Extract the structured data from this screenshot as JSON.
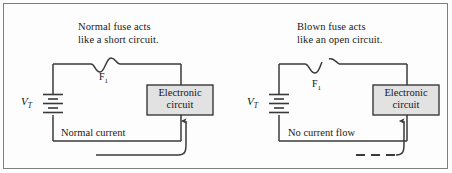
{
  "figure": {
    "border_color": "#7e7e7e",
    "background": "#fdfdfd",
    "wire_color": "#3a3a3a",
    "box_fill": "#e2e2e2",
    "box_border": "#2b2b2b",
    "text_color": "#1a1a1a"
  },
  "panels": [
    {
      "id": "normal-fuse-panel",
      "caption_line1": "Normal fuse acts",
      "caption_line2": "like a short circuit.",
      "source_label": "V",
      "source_subscript": "T",
      "fuse_label": "F",
      "fuse_subscript": "1",
      "fuse_state": "intact",
      "load_line1": "Electronic",
      "load_line2": "circuit",
      "current_label": "Normal current",
      "arrow_style": "solid"
    },
    {
      "id": "blown-fuse-panel",
      "caption_line1": "Blown fuse acts",
      "caption_line2": "like an open circuit.",
      "source_label": "V",
      "source_subscript": "T",
      "fuse_label": "F",
      "fuse_subscript": "1",
      "fuse_state": "blown",
      "load_line1": "Electronic",
      "load_line2": "circuit",
      "current_label": "No current flow",
      "arrow_style": "dashed"
    }
  ]
}
